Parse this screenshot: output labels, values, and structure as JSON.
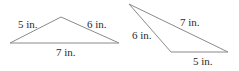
{
  "figure": {
    "unit": "in.",
    "triangles": [
      {
        "id": "triangle-1",
        "sides": [
          {
            "length": 5,
            "label": "5 in."
          },
          {
            "length": 6,
            "label": "6 in."
          },
          {
            "length": 7,
            "label": "7 in."
          }
        ]
      },
      {
        "id": "triangle-2",
        "sides": [
          {
            "length": 7,
            "label": "7 in."
          },
          {
            "length": 6,
            "label": "6 in."
          },
          {
            "length": 5,
            "label": "5 in."
          }
        ]
      }
    ]
  }
}
